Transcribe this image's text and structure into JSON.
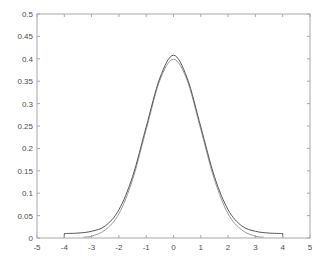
{
  "chart_data": {
    "type": "line",
    "title": "",
    "xlabel": "",
    "ylabel": "",
    "xlim": [
      -5,
      5
    ],
    "ylim": [
      0,
      0.5
    ],
    "grid": false,
    "legend": null,
    "xticks": [
      "-5",
      "-4",
      "-3",
      "-2",
      "-1",
      "0",
      "1",
      "2",
      "3",
      "4",
      "5"
    ],
    "yticks": [
      "0",
      "0.05",
      "0.1",
      "0.15",
      "0.2",
      "0.25",
      "0.3",
      "0.35",
      "0.4",
      "0.45",
      "0.5"
    ],
    "series": [
      {
        "name": "estimated density",
        "color": "#555555",
        "x": [
          -4,
          -3.5,
          -3,
          -2.5,
          -2,
          -1.5,
          -1,
          -0.5,
          0,
          0.5,
          1,
          1.5,
          2,
          2.5,
          3,
          3.5,
          4
        ],
        "y": [
          0.01,
          0.011,
          0.015,
          0.027,
          0.063,
          0.137,
          0.248,
          0.357,
          0.408,
          0.357,
          0.248,
          0.137,
          0.063,
          0.027,
          0.015,
          0.011,
          0.01
        ]
      },
      {
        "name": "standard normal pdf",
        "color": "#9a9a9a",
        "x": [
          -3.3,
          -3,
          -2.5,
          -2,
          -1.5,
          -1,
          -0.5,
          0,
          0.5,
          1,
          1.5,
          2,
          2.5,
          3,
          3.3
        ],
        "y": [
          0.002,
          0.004,
          0.018,
          0.054,
          0.13,
          0.242,
          0.352,
          0.399,
          0.352,
          0.242,
          0.13,
          0.054,
          0.018,
          0.004,
          0.002
        ]
      }
    ]
  }
}
